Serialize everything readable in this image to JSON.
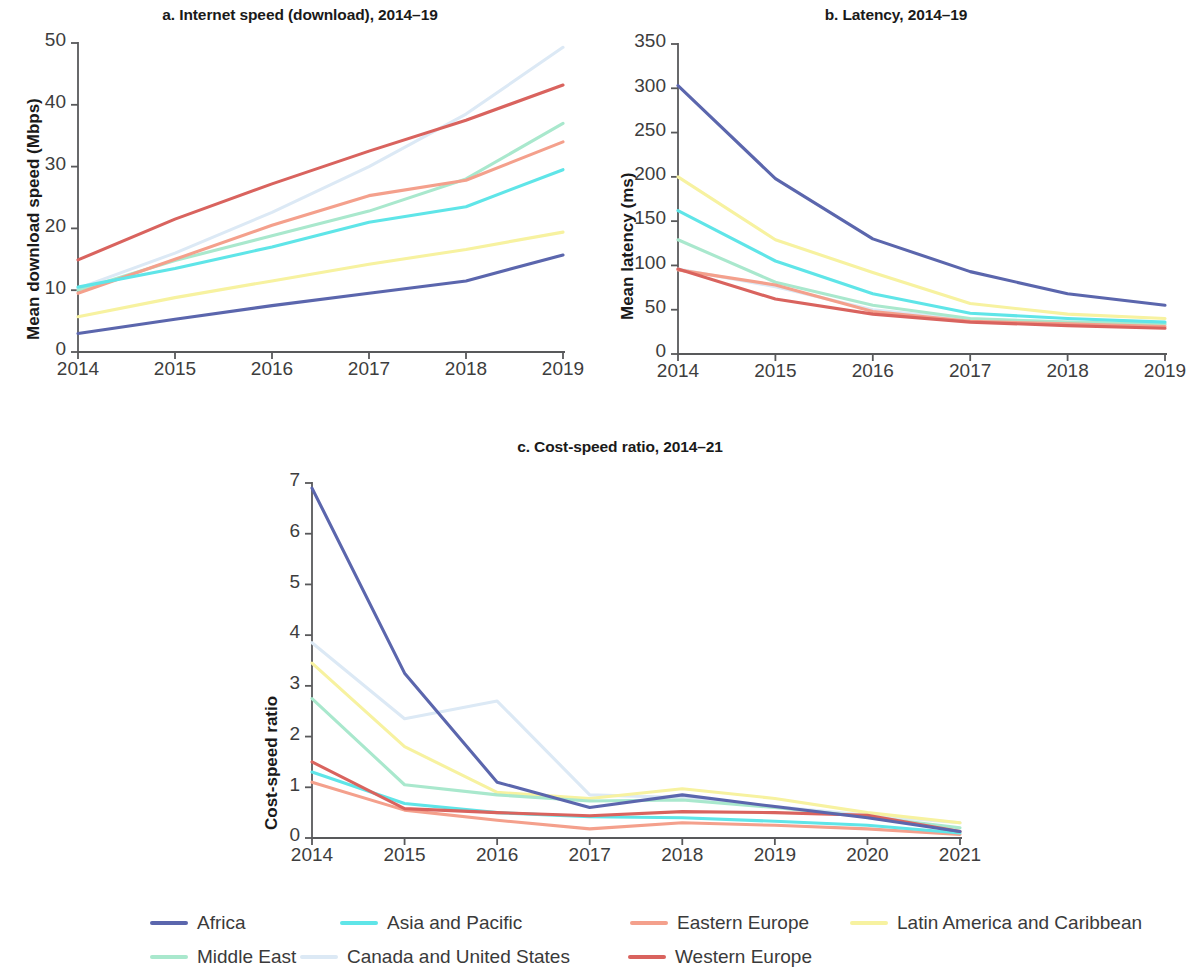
{
  "figure": {
    "legend": {
      "rows": [
        [
          {
            "label": "Africa",
            "color": "#5b66ad",
            "key": "africa"
          },
          {
            "label": "Asia and Pacific",
            "color": "#5fe5e8",
            "key": "asia_and_pacific"
          },
          {
            "label": "Eastern Europe",
            "color": "#f4a08c",
            "key": "eastern_europe"
          },
          {
            "label": "Latin America and Caribbean",
            "color": "#f7f2a0",
            "key": "latin_america_and_caribbean"
          }
        ],
        [
          {
            "label": "Middle East",
            "color": "#a9e8cd",
            "key": "middle_east"
          },
          {
            "label": "Canada and United States",
            "color": "#dce9f5",
            "key": "canada_and_united_states"
          },
          {
            "label": "Western Europe",
            "color": "#d9635e",
            "key": "western_europe"
          }
        ]
      ]
    }
  },
  "chart_data": [
    {
      "id": "a",
      "type": "line",
      "title": "a. Internet speed (download), 2014–19",
      "xlabel": "",
      "ylabel": "Mean download speed (Mbps)",
      "x": [
        2014,
        2015,
        2016,
        2017,
        2018,
        2019
      ],
      "xticklabels": [
        "2014",
        "2015",
        "2016",
        "2017",
        "2018",
        "2019"
      ],
      "yticks": [
        0,
        10,
        20,
        30,
        40,
        50
      ],
      "yticklabels": [
        "0",
        "10",
        "20",
        "30",
        "40",
        "50"
      ],
      "ylim": [
        0,
        50
      ],
      "grid": false,
      "legend_position": "below-figure",
      "series": [
        {
          "name": "Africa",
          "color": "#5b66ad",
          "values": [
            3.0,
            5.3,
            7.5,
            9.5,
            11.5,
            15.7
          ]
        },
        {
          "name": "Asia and Pacific",
          "color": "#5fe5e8",
          "values": [
            10.5,
            13.5,
            17.0,
            21.0,
            23.5,
            29.5
          ]
        },
        {
          "name": "Eastern Europe",
          "color": "#f4a08c",
          "values": [
            9.5,
            15.0,
            20.5,
            25.3,
            27.8,
            34.0
          ]
        },
        {
          "name": "Latin America and Caribbean",
          "color": "#f7f2a0",
          "values": [
            5.7,
            8.8,
            11.5,
            14.2,
            16.6,
            19.4
          ]
        },
        {
          "name": "Middle East",
          "color": "#a9e8cd",
          "values": [
            10.0,
            14.8,
            18.8,
            22.8,
            28.0,
            37.0
          ]
        },
        {
          "name": "Canada and United States",
          "color": "#dce9f5",
          "values": [
            10.3,
            16.0,
            22.6,
            30.0,
            38.5,
            49.3
          ]
        },
        {
          "name": "Western Europe",
          "color": "#d9635e",
          "values": [
            14.9,
            21.5,
            27.2,
            32.5,
            37.5,
            43.2
          ]
        }
      ]
    },
    {
      "id": "b",
      "type": "line",
      "title": "b. Latency, 2014–19",
      "xlabel": "",
      "ylabel": "Mean latency (ms)",
      "x": [
        2014,
        2015,
        2016,
        2017,
        2018,
        2019
      ],
      "xticklabels": [
        "2014",
        "2015",
        "2016",
        "2017",
        "2018",
        "2019"
      ],
      "yticks": [
        0,
        50,
        100,
        150,
        200,
        250,
        300,
        350
      ],
      "yticklabels": [
        "0",
        "50",
        "100",
        "150",
        "200",
        "250",
        "300",
        "350"
      ],
      "ylim": [
        0,
        350
      ],
      "grid": false,
      "legend_position": "below-figure",
      "series": [
        {
          "name": "Africa",
          "color": "#5b66ad",
          "values": [
            303,
            198,
            130,
            93,
            68,
            55
          ]
        },
        {
          "name": "Asia and Pacific",
          "color": "#5fe5e8",
          "values": [
            162,
            105,
            68,
            46,
            40,
            36
          ]
        },
        {
          "name": "Eastern Europe",
          "color": "#f4a08c",
          "values": [
            95,
            78,
            48,
            37,
            34,
            31
          ]
        },
        {
          "name": "Latin America and Caribbean",
          "color": "#f7f2a0",
          "values": [
            200,
            129,
            92,
            57,
            45,
            40
          ]
        },
        {
          "name": "Middle East",
          "color": "#a9e8cd",
          "values": [
            129,
            81,
            55,
            40,
            36,
            34
          ]
        },
        {
          "name": "Canada and United States",
          "color": "#dce9f5",
          "values": [
            96,
            76,
            50,
            39,
            36,
            33
          ]
        },
        {
          "name": "Western Europe",
          "color": "#d9635e",
          "values": [
            96,
            62,
            45,
            36,
            32,
            29
          ]
        }
      ]
    },
    {
      "id": "c",
      "type": "line",
      "title": "c. Cost-speed ratio, 2014–21",
      "xlabel": "",
      "ylabel": "Cost-speed ratio",
      "x": [
        2014,
        2015,
        2016,
        2017,
        2018,
        2019,
        2020,
        2021
      ],
      "xticklabels": [
        "2014",
        "2015",
        "2016",
        "2017",
        "2018",
        "2019",
        "2020",
        "2021"
      ],
      "yticks": [
        0,
        1,
        2,
        3,
        4,
        5,
        6,
        7
      ],
      "yticklabels": [
        "0",
        "1",
        "2",
        "3",
        "4",
        "5",
        "6",
        "7"
      ],
      "ylim": [
        0,
        7
      ],
      "grid": false,
      "legend_position": "below-figure",
      "series": [
        {
          "name": "Africa",
          "color": "#5b66ad",
          "values": [
            6.9,
            3.25,
            1.1,
            0.6,
            0.85,
            0.62,
            0.4,
            0.13
          ]
        },
        {
          "name": "Asia and Pacific",
          "color": "#5fe5e8",
          "values": [
            1.3,
            0.68,
            0.5,
            0.42,
            0.4,
            0.33,
            0.25,
            0.1
          ]
        },
        {
          "name": "Eastern Europe",
          "color": "#f4a08c",
          "values": [
            1.1,
            0.55,
            0.35,
            0.18,
            0.3,
            0.25,
            0.18,
            0.07
          ]
        },
        {
          "name": "Latin America and Caribbean",
          "color": "#f7f2a0",
          "values": [
            3.45,
            1.8,
            0.9,
            0.78,
            0.97,
            0.78,
            0.5,
            0.3
          ]
        },
        {
          "name": "Middle East",
          "color": "#a9e8cd",
          "values": [
            2.75,
            1.05,
            0.85,
            0.73,
            0.75,
            0.6,
            0.42,
            0.2
          ]
        },
        {
          "name": "Canada and United States",
          "color": "#dce9f5",
          "values": [
            3.85,
            2.35,
            2.7,
            0.85,
            0.8,
            0.62,
            0.45,
            0.3
          ]
        },
        {
          "name": "Western Europe",
          "color": "#d9635e",
          "values": [
            1.5,
            0.58,
            0.5,
            0.44,
            0.52,
            0.5,
            0.45,
            0.13
          ]
        }
      ]
    }
  ]
}
